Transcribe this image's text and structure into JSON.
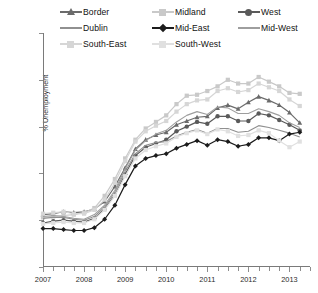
{
  "chart_data": {
    "type": "line",
    "title": "",
    "xlabel": "",
    "ylabel": "% Unemployment",
    "ylim": [
      0,
      25
    ],
    "yticks": [
      0,
      5,
      10,
      15,
      20,
      25
    ],
    "xlim": [
      2007.0,
      2013.5
    ],
    "xticks": [
      2007,
      2008,
      2009,
      2010,
      2011,
      2012,
      2013
    ],
    "xtick_labels": [
      "2007",
      "2008",
      "2009",
      "2010",
      "2011",
      "2012",
      "2013"
    ],
    "minor_xticks_per_year": 4,
    "grid": false,
    "legend_position": "top",
    "x": [
      2007.0,
      2007.25,
      2007.5,
      2007.75,
      2008.0,
      2008.25,
      2008.5,
      2008.75,
      2009.0,
      2009.25,
      2009.5,
      2009.75,
      2010.0,
      2010.25,
      2010.5,
      2010.75,
      2011.0,
      2011.25,
      2011.5,
      2011.75,
      2012.0,
      2012.25,
      2012.5,
      2012.75,
      2013.0,
      2013.25
    ],
    "series": [
      {
        "name": "Border",
        "marker": "triangle",
        "color": "#6b6b6b",
        "values": [
          5.6,
          5.7,
          5.9,
          5.8,
          5.9,
          6.2,
          7.0,
          8.6,
          10.6,
          12.6,
          13.6,
          14.1,
          14.4,
          15.2,
          15.6,
          16.0,
          16.1,
          17.0,
          17.3,
          16.9,
          17.6,
          18.2,
          17.8,
          17.3,
          16.5,
          15.4
        ]
      },
      {
        "name": "Midland",
        "marker": "square",
        "color": "#c9c9c9",
        "values": [
          5.3,
          5.4,
          5.5,
          5.6,
          5.8,
          6.3,
          7.6,
          9.4,
          11.6,
          13.6,
          14.8,
          15.5,
          16.2,
          17.4,
          18.3,
          18.4,
          18.8,
          19.3,
          20.0,
          19.6,
          19.6,
          20.3,
          19.8,
          19.3,
          18.6,
          18.5
        ]
      },
      {
        "name": "West",
        "marker": "circle",
        "color": "#5a5a5a",
        "values": [
          4.7,
          4.9,
          5.0,
          4.9,
          4.8,
          5.2,
          6.2,
          7.7,
          9.9,
          11.9,
          12.8,
          13.2,
          13.6,
          14.5,
          15.0,
          15.5,
          15.3,
          16.1,
          16.1,
          15.6,
          15.6,
          16.4,
          16.2,
          15.7,
          15.2,
          14.6
        ]
      },
      {
        "name": "Dublin",
        "marker": "none",
        "color": "#909090",
        "values": [
          5.2,
          5.3,
          5.3,
          5.1,
          5.0,
          5.4,
          6.4,
          8.0,
          10.2,
          12.1,
          13.0,
          13.3,
          13.4,
          14.0,
          14.4,
          14.7,
          14.3,
          14.8,
          14.8,
          14.4,
          14.5,
          15.1,
          14.9,
          14.6,
          14.3,
          13.9
        ]
      },
      {
        "name": "Mid-East",
        "marker": "diamond",
        "color": "#1c1c1c",
        "values": [
          4.1,
          4.1,
          4.0,
          3.9,
          3.9,
          4.2,
          5.1,
          6.6,
          8.8,
          10.8,
          11.6,
          11.9,
          12.1,
          12.7,
          13.1,
          13.5,
          13.0,
          13.6,
          13.4,
          12.9,
          13.1,
          13.8,
          13.8,
          13.5,
          14.2,
          14.4
        ]
      },
      {
        "name": "Mid-West",
        "marker": "none",
        "color": "#9e9e9e",
        "values": [
          5.4,
          5.5,
          5.4,
          5.2,
          5.1,
          5.6,
          6.6,
          8.2,
          10.5,
          12.5,
          13.5,
          14.2,
          14.6,
          15.5,
          16.2,
          16.6,
          16.3,
          17.1,
          17.0,
          16.4,
          16.4,
          16.9,
          16.6,
          16.2,
          15.4,
          14.9
        ]
      },
      {
        "name": "South-East",
        "marker": "square",
        "color": "#d6d6d6",
        "values": [
          5.7,
          5.8,
          5.9,
          5.7,
          5.7,
          6.1,
          7.2,
          9.0,
          11.3,
          13.4,
          14.5,
          15.1,
          15.6,
          16.6,
          17.4,
          17.8,
          17.9,
          18.8,
          19.1,
          18.7,
          18.9,
          19.6,
          19.2,
          18.8,
          17.9,
          17.2
        ]
      },
      {
        "name": "South-West",
        "marker": "square",
        "color": "#e0e0e0",
        "values": [
          4.6,
          4.7,
          4.8,
          4.7,
          4.7,
          5.1,
          6.1,
          7.6,
          9.7,
          11.6,
          12.5,
          12.9,
          13.2,
          13.9,
          14.3,
          14.6,
          14.2,
          14.7,
          14.5,
          14.0,
          14.1,
          14.6,
          14.3,
          13.5,
          12.8,
          13.4
        ]
      }
    ]
  },
  "legend": {
    "rows": [
      [
        {
          "label": "Border",
          "marker": "triangle",
          "color": "#6b6b6b",
          "line": true
        },
        {
          "label": "Midland",
          "marker": "square",
          "color": "#c9c9c9",
          "line": true
        },
        {
          "label": "West",
          "marker": "circle",
          "color": "#5a5a5a",
          "line": true
        }
      ],
      [
        {
          "label": "Dublin",
          "marker": "none",
          "color": "#909090",
          "line": true
        },
        {
          "label": "Mid-East",
          "marker": "diamond",
          "color": "#1c1c1c",
          "line": true
        },
        {
          "label": "Mid-West",
          "marker": "none",
          "color": "#9e9e9e",
          "line": true
        }
      ],
      [
        {
          "label": "South-East",
          "marker": "square",
          "color": "#d6d6d6",
          "line": true
        },
        {
          "label": "South-West",
          "marker": "square",
          "color": "#e0e0e0",
          "line": true
        }
      ]
    ]
  },
  "axis": {
    "y_label": "% Unemployment",
    "y_ticks": [
      "0",
      "5",
      "10",
      "15",
      "20",
      "25"
    ],
    "x_ticks": [
      "2007",
      "2008",
      "2009",
      "2010",
      "2011",
      "2012",
      "2013"
    ]
  }
}
